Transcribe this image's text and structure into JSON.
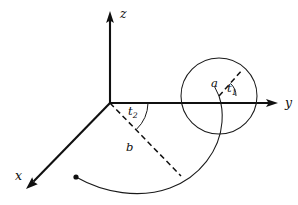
{
  "figure": {
    "kind": "3d-coordinate-diagram",
    "background_color": "#ffffff",
    "ink_color": "#101010",
    "axes": {
      "origin": {
        "x": 110,
        "y": 103
      },
      "items": [
        {
          "name": "z-axis",
          "label": "z",
          "tip": {
            "x": 110,
            "y": 13
          },
          "label_pos": {
            "x": 120,
            "y": 8
          }
        },
        {
          "name": "y-axis",
          "label": "y",
          "tip": {
            "x": 277,
            "y": 103
          },
          "label_pos": {
            "x": 285,
            "y": 97
          }
        },
        {
          "name": "x-axis",
          "label": "x",
          "tip": {
            "x": 27,
            "y": 188
          },
          "label_pos": {
            "x": 15,
            "y": 170
          }
        }
      ]
    },
    "circle": {
      "name": "generating-circle",
      "center": {
        "x": 219,
        "y": 96
      },
      "radius": 38,
      "stroke_color": "#1a1a1a"
    },
    "radius_segment": {
      "name": "radius-a",
      "label": "a",
      "from": {
        "x": 219,
        "y": 96
      },
      "to": {
        "x": 243,
        "y": 69
      },
      "style": "dashed",
      "label_pos": {
        "x": 211,
        "y": 78
      }
    },
    "angle_t1": {
      "name": "angle-t1",
      "label": "t",
      "subscript": "1",
      "vertex": {
        "x": 219,
        "y": 96
      },
      "radius": 17,
      "from_deg": -48,
      "to_deg": 0,
      "label_pos": {
        "x": 227,
        "y": 83
      }
    },
    "radius_segment_b": {
      "name": "radius-b",
      "label": "b",
      "from": {
        "x": 110,
        "y": 103
      },
      "to": {
        "x": 181,
        "y": 176
      },
      "style": "dashed",
      "label_pos": {
        "x": 126,
        "y": 142
      }
    },
    "angle_t2": {
      "name": "angle-t2",
      "label": "t",
      "subscript": "2",
      "vertex": {
        "x": 110,
        "y": 103
      },
      "radius": 38,
      "from_deg": 0,
      "to_deg": 46,
      "label_pos": {
        "x": 128,
        "y": 106
      }
    },
    "trajectory": {
      "name": "spiral-trajectory",
      "start_point": {
        "x": 76,
        "y": 177
      },
      "start_dot_radius": 2.6,
      "end_point": {
        "x": 219,
        "y": 96
      },
      "path": "M 76 177 C 104 193 140 199 170 188 C 200 177 220 150 222 122 C 223 110 221 102 219 96"
    }
  }
}
